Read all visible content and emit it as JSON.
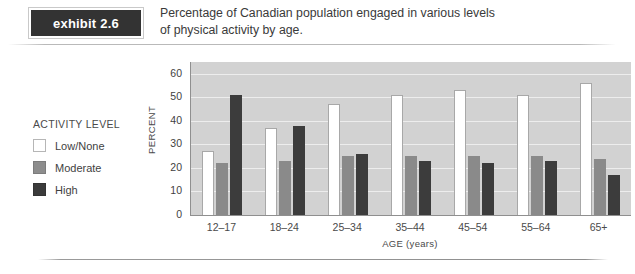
{
  "exhibit": {
    "word": "exhibit",
    "number": "2.6"
  },
  "caption": {
    "line1": "Percentage of Canadian population engaged in various levels",
    "line2": "of physical activity by age."
  },
  "legend": {
    "title": "ACTIVITY LEVEL",
    "items": [
      {
        "label": "Low/None",
        "color": "#ffffff"
      },
      {
        "label": "Moderate",
        "color": "#8a8a8a"
      },
      {
        "label": "High",
        "color": "#3c3c3c"
      }
    ]
  },
  "chart_data": {
    "type": "bar",
    "title": "Percentage of Canadian population engaged in various levels of physical activity by age.",
    "xlabel": "AGE (years)",
    "ylabel": "PERCENT",
    "categories": [
      "12–17",
      "18–24",
      "25–34",
      "35–44",
      "45–54",
      "55–64",
      "65+"
    ],
    "yticks": [
      0,
      10,
      20,
      30,
      40,
      50,
      60
    ],
    "ylim": [
      0,
      65
    ],
    "grid": true,
    "legend_position": "left-outside",
    "series": [
      {
        "name": "Low/None",
        "color": "#ffffff",
        "values": [
          27,
          37,
          47,
          51,
          53,
          51,
          56
        ]
      },
      {
        "name": "Moderate",
        "color": "#8a8a8a",
        "values": [
          22,
          23,
          25,
          25,
          25,
          25,
          24
        ]
      },
      {
        "name": "High",
        "color": "#3c3c3c",
        "values": [
          51,
          38,
          26,
          23,
          22,
          23,
          17
        ]
      }
    ]
  }
}
